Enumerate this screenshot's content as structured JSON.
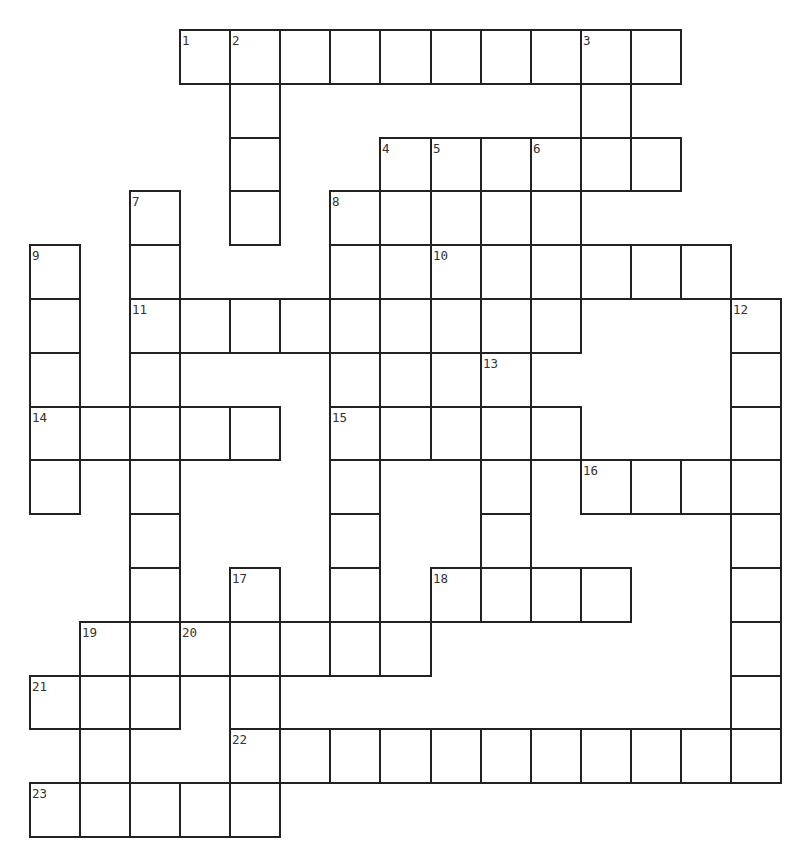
{
  "puzzle": {
    "type": "crossword",
    "colors": {
      "grid_line": "#222222",
      "cell_fill": "#ffffff",
      "number_text": "#333333",
      "background": "#ffffff"
    },
    "grid": {
      "origin_x": 30,
      "origin_y": 30,
      "cell_width": 50.07,
      "cell_height": 53.8,
      "columns": 15,
      "rows": 15
    },
    "clue_numbers": [
      {
        "num": "1",
        "row": 0,
        "col": 3
      },
      {
        "num": "2",
        "row": 0,
        "col": 4
      },
      {
        "num": "3",
        "row": 0,
        "col": 11
      },
      {
        "num": "4",
        "row": 2,
        "col": 7
      },
      {
        "num": "5",
        "row": 2,
        "col": 8
      },
      {
        "num": "6",
        "row": 2,
        "col": 10
      },
      {
        "num": "7",
        "row": 3,
        "col": 2
      },
      {
        "num": "8",
        "row": 3,
        "col": 6
      },
      {
        "num": "9",
        "row": 4,
        "col": 0
      },
      {
        "num": "10",
        "row": 4,
        "col": 8
      },
      {
        "num": "11",
        "row": 5,
        "col": 2
      },
      {
        "num": "12",
        "row": 5,
        "col": 14
      },
      {
        "num": "13",
        "row": 6,
        "col": 9
      },
      {
        "num": "14",
        "row": 7,
        "col": 0
      },
      {
        "num": "15",
        "row": 7,
        "col": 6
      },
      {
        "num": "16",
        "row": 8,
        "col": 11
      },
      {
        "num": "17",
        "row": 10,
        "col": 4
      },
      {
        "num": "18",
        "row": 10,
        "col": 8
      },
      {
        "num": "19",
        "row": 11,
        "col": 1
      },
      {
        "num": "20",
        "row": 11,
        "col": 3
      },
      {
        "num": "21",
        "row": 12,
        "col": 0
      },
      {
        "num": "22",
        "row": 13,
        "col": 4
      },
      {
        "num": "23",
        "row": 14,
        "col": 0
      }
    ],
    "rows": [
      {
        "row": 0,
        "cols": [
          3,
          4,
          5,
          6,
          7,
          8,
          9,
          10,
          11,
          12
        ]
      },
      {
        "row": 1,
        "cols": [
          4,
          11
        ]
      },
      {
        "row": 2,
        "cols": [
          4,
          7,
          8,
          9,
          10,
          11,
          12
        ]
      },
      {
        "row": 3,
        "cols": [
          2,
          4,
          6,
          7,
          8,
          9,
          10
        ]
      },
      {
        "row": 4,
        "cols": [
          0,
          2,
          6,
          7,
          8,
          9,
          10,
          11,
          12,
          13
        ]
      },
      {
        "row": 5,
        "cols": [
          0,
          2,
          3,
          4,
          5,
          6,
          7,
          8,
          9,
          10,
          14
        ]
      },
      {
        "row": 6,
        "cols": [
          0,
          2,
          6,
          7,
          9,
          14
        ]
      },
      {
        "row": 7,
        "cols": [
          0,
          1,
          2,
          3,
          4,
          6,
          7,
          8,
          9,
          10,
          14
        ]
      },
      {
        "row": 8,
        "cols": [
          0,
          2,
          6,
          9,
          11,
          12,
          13,
          14
        ]
      },
      {
        "row": 9,
        "cols": [
          2,
          6,
          9,
          14
        ]
      },
      {
        "row": 10,
        "cols": [
          2,
          4,
          6,
          8,
          9,
          10,
          11,
          14
        ]
      },
      {
        "row": 11,
        "cols": [
          1,
          2,
          3,
          4,
          5,
          6,
          7,
          14
        ]
      },
      {
        "row": 12,
        "cols": [
          0,
          1,
          2,
          4,
          14
        ]
      },
      {
        "row": 13,
        "cols": [
          1,
          4,
          5,
          6,
          7,
          8,
          9,
          10,
          11,
          12,
          13,
          14
        ]
      },
      {
        "row": 14,
        "cols": [
          0,
          1,
          2,
          3,
          4
        ]
      }
    ],
    "entries": {
      "1_across": {
        "row": 0,
        "col": 3,
        "length": 10
      },
      "2_down": {
        "row": 0,
        "col": 4,
        "length": 4
      },
      "3_down": {
        "row": 0,
        "col": 11,
        "length": 3
      },
      "4_across": {
        "row": 2,
        "col": 7,
        "length": 6
      },
      "4_down": {
        "row": 2,
        "col": 7,
        "length": 6
      },
      "5_down": {
        "row": 2,
        "col": 8,
        "length": 4
      },
      "6_down": {
        "row": 2,
        "col": 10,
        "length": 4
      },
      "7_down": {
        "row": 3,
        "col": 2,
        "length": 10
      },
      "8_down": {
        "row": 3,
        "col": 6,
        "length": 9
      },
      "9_down": {
        "row": 4,
        "col": 0,
        "length": 5
      },
      "10_across": {
        "row": 4,
        "col": 8,
        "length": 6
      },
      "11_across": {
        "row": 5,
        "col": 2,
        "length": 9
      },
      "12_down": {
        "row": 5,
        "col": 14,
        "length": 9
      },
      "13_down": {
        "row": 6,
        "col": 9,
        "length": 5
      },
      "14_across": {
        "row": 7,
        "col": 0,
        "length": 5
      },
      "15_across": {
        "row": 7,
        "col": 6,
        "length": 5
      },
      "16_across": {
        "row": 8,
        "col": 11,
        "length": 4
      },
      "17_down": {
        "row": 10,
        "col": 4,
        "length": 5
      },
      "18_across": {
        "row": 10,
        "col": 8,
        "length": 4
      },
      "19_down": {
        "row": 11,
        "col": 1,
        "length": 4
      },
      "20_across": {
        "row": 11,
        "col": 3,
        "length": 5
      },
      "21_across": {
        "row": 12,
        "col": 0,
        "length": 3
      },
      "22_across": {
        "row": 13,
        "col": 4,
        "length": 11
      },
      "23_across": {
        "row": 14,
        "col": 0,
        "length": 5
      }
    },
    "cell_values": {}
  }
}
